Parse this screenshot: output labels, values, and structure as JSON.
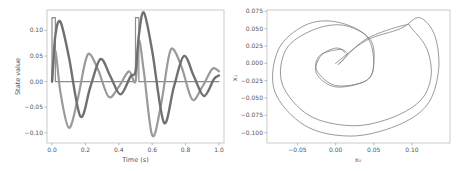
{
  "chart_data": [
    {
      "type": "line",
      "title": "",
      "xlabel": "Time (s)",
      "ylabel": "State value",
      "xlim": [
        -0.03,
        1.03
      ],
      "ylim": [
        -0.12,
        0.14
      ],
      "xticks": [
        0.0,
        0.2,
        0.4,
        0.6,
        0.8,
        1.0
      ],
      "xtick_labels": [
        "0.0",
        "0.2",
        "0.4",
        "0.6",
        "0.8",
        "1.0"
      ],
      "yticks": [
        -0.1,
        -0.05,
        0.0,
        0.05,
        0.1
      ],
      "ytick_labels": [
        "−0.10",
        "−0.05",
        "0.00",
        "0.05",
        "0.10"
      ],
      "grid": false,
      "legend": null,
      "series": [
        {
          "name": "input (pulse)",
          "color": "#8c8c8c",
          "description": "rectangular pulses of height 0.125 from t=0.0 to 0.02 and from t=0.5 to 0.52, otherwise 0",
          "x": [
            0.0,
            0.0,
            0.02,
            0.02,
            0.5,
            0.5,
            0.52,
            0.52,
            1.0
          ],
          "y": [
            0.0,
            0.125,
            0.125,
            0.0,
            0.0,
            0.125,
            0.125,
            0.0,
            0.0
          ]
        },
        {
          "name": "state x0",
          "color": "#9a9a9a",
          "x": [
            0.0,
            0.02,
            0.05,
            0.1,
            0.15,
            0.2,
            0.23,
            0.28,
            0.34,
            0.4,
            0.46,
            0.5,
            0.52,
            0.55,
            0.6,
            0.65,
            0.7,
            0.73,
            0.78,
            0.84,
            0.9,
            0.96,
            1.0
          ],
          "y": [
            0.0,
            0.06,
            -0.02,
            -0.09,
            -0.04,
            0.04,
            0.053,
            0.02,
            -0.03,
            -0.01,
            0.02,
            0.0,
            0.08,
            0.02,
            -0.105,
            -0.05,
            0.05,
            0.062,
            0.025,
            -0.035,
            -0.01,
            0.025,
            0.02
          ]
        },
        {
          "name": "state x1",
          "color": "#707070",
          "x": [
            0.0,
            0.02,
            0.05,
            0.1,
            0.17,
            0.23,
            0.29,
            0.35,
            0.41,
            0.47,
            0.5,
            0.52,
            0.55,
            0.6,
            0.67,
            0.73,
            0.79,
            0.85,
            0.91,
            0.97,
            1.0
          ],
          "y": [
            0.0,
            0.09,
            0.117,
            0.05,
            -0.068,
            -0.01,
            0.044,
            0.01,
            -0.025,
            0.01,
            0.02,
            0.09,
            0.135,
            0.06,
            -0.08,
            -0.01,
            0.05,
            0.01,
            -0.028,
            0.005,
            0.012
          ]
        }
      ]
    },
    {
      "type": "line",
      "title": "",
      "xlabel": "x₀",
      "ylabel": "x₁",
      "xlim": [
        -0.09,
        0.15
      ],
      "ylim": [
        -0.115,
        0.077
      ],
      "xticks": [
        -0.05,
        0.0,
        0.05,
        0.1
      ],
      "xtick_labels": [
        "−0.05",
        "0.00",
        "0.05",
        "0.10"
      ],
      "yticks": [
        -0.1,
        -0.075,
        -0.05,
        -0.025,
        0.0,
        0.025,
        0.05,
        0.075
      ],
      "ytick_labels": [
        "−0.100",
        "−0.075",
        "−0.050",
        "−0.025",
        "0.000",
        "0.025",
        "0.050",
        "0.075"
      ],
      "grid": false,
      "legend": null,
      "series": [
        {
          "name": "phase trajectory",
          "color": "#808080",
          "description": "noisy spiral phase portrait starting at origin, looping twice around",
          "x": [
            0.0,
            0.04,
            0.085,
            0.11,
            0.13,
            0.135,
            0.12,
            0.08,
            0.02,
            -0.04,
            -0.08,
            -0.075,
            -0.04,
            0.0,
            0.04,
            0.05,
            0.04,
            0.0,
            -0.025,
            -0.02,
            0.0,
            0.015,
            0.01,
            0.005,
            0.04,
            0.09,
            0.1,
            0.12,
            0.125,
            0.11,
            0.07,
            0.02,
            -0.035,
            -0.07,
            -0.065,
            -0.03,
            0.01,
            0.045,
            0.05,
            0.04,
            0.0,
            -0.025,
            -0.02,
            0.005,
            0.012
          ],
          "y": [
            0.0,
            0.033,
            0.05,
            0.066,
            0.04,
            -0.01,
            -0.06,
            -0.09,
            -0.105,
            -0.09,
            -0.04,
            0.02,
            0.055,
            0.06,
            0.04,
            0.0,
            -0.025,
            -0.034,
            -0.015,
            0.01,
            0.022,
            0.015,
            0.005,
            0.0,
            0.035,
            0.055,
            0.05,
            0.02,
            -0.02,
            -0.055,
            -0.08,
            -0.09,
            -0.075,
            -0.03,
            0.02,
            0.048,
            0.055,
            0.035,
            0.0,
            -0.025,
            -0.032,
            -0.01,
            0.012,
            0.02,
            0.015
          ]
        }
      ]
    }
  ]
}
